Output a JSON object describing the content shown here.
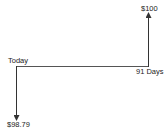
{
  "diagram": {
    "type": "cash-flow-timeline",
    "start_label": "Today",
    "end_label": "91 Days",
    "outflow": {
      "label": "$98.79",
      "time": "Today",
      "direction": "down"
    },
    "inflow": {
      "label": "$100",
      "time": "91 Days",
      "direction": "up"
    },
    "line_color": "#333333"
  }
}
